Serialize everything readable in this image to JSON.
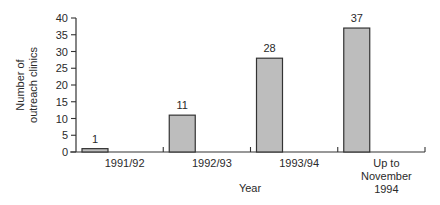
{
  "chart_data": {
    "type": "bar",
    "title": "",
    "xlabel": "Year",
    "ylabel": "Number of outreach clinics",
    "ylabel_lines": [
      "Number of",
      "outreach clinics"
    ],
    "categories": [
      "1991/92",
      "1992/93",
      "1993/94",
      "Up to November 1994"
    ],
    "category_lines": [
      [
        "1991/92"
      ],
      [
        "1992/93"
      ],
      [
        "1993/94"
      ],
      [
        "Up to",
        "November",
        "1994"
      ]
    ],
    "values": [
      1,
      11,
      28,
      37
    ],
    "data_labels": [
      "1",
      "11",
      "28",
      "37"
    ],
    "ylim": [
      0,
      40
    ],
    "yticks": [
      0,
      5,
      10,
      15,
      20,
      25,
      30,
      35,
      40
    ],
    "grid": false,
    "legend": null,
    "bar_color": "#bdbdbd",
    "bar_edge_color": "#333333"
  }
}
